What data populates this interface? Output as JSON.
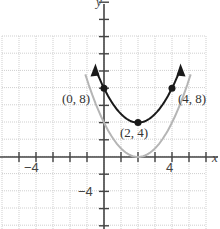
{
  "chart_data": {
    "type": "line",
    "title": "",
    "xlabel": "x",
    "ylabel": "y",
    "xlim": [
      -6,
      6
    ],
    "ylim": [
      -8,
      18
    ],
    "grid": true,
    "x_ticks_labeled": [
      -4,
      4
    ],
    "y_ticks_labeled": [
      -4,
      4
    ],
    "series": [
      {
        "name": "y = (x-2)^2 + 4",
        "color": "#1a1a1a",
        "x": [
          -0.5,
          0,
          1,
          2,
          3,
          4,
          4.5
        ],
        "y": [
          10.25,
          8,
          5,
          4,
          5,
          8,
          10.25
        ]
      },
      {
        "name": "y = (x-2)^2",
        "color": "#b0b0b0",
        "x": [
          -0.9,
          0,
          1,
          2,
          3,
          4,
          4.9
        ],
        "y": [
          8.41,
          4,
          1,
          0,
          1,
          4,
          8.41
        ]
      }
    ],
    "annotations": [
      {
        "text": "(0, 8)",
        "x": 0,
        "y": 8
      },
      {
        "text": "(2, 4)",
        "x": 2,
        "y": 4
      },
      {
        "text": "(4, 8)",
        "x": 4,
        "y": 8
      }
    ]
  },
  "labels": {
    "p1": "(0, 8)",
    "p2": "(2, 4)",
    "p3": "(4, 8)",
    "x_axis": "x",
    "y_axis": "y",
    "xneg": "−4",
    "xpos": "4",
    "yneg": "−4"
  }
}
